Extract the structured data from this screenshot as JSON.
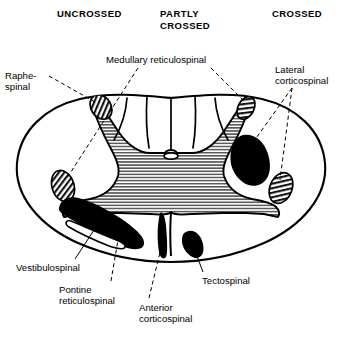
{
  "figure": {
    "headers": [
      {
        "id": "uncrossed",
        "text": "UNCROSSED"
      },
      {
        "id": "partly-crossed",
        "text": "PARTLY\nCROSSED"
      },
      {
        "id": "crossed",
        "text": "CROSSED"
      }
    ],
    "labels": [
      {
        "id": "raphespinal",
        "text": "Raphe-\nspinal"
      },
      {
        "id": "medullary-reticulospinal",
        "text": "Medullary reticulospinal"
      },
      {
        "id": "lateral-corticospinal",
        "text": "Lateral\ncorticospinal"
      },
      {
        "id": "vestibulospinal",
        "text": "Vestibulospinal"
      },
      {
        "id": "pontine-reticulospinal",
        "text": "Pontine\nreticulospinal"
      },
      {
        "id": "anterior-corticospinal",
        "text": "Anterior\ncorticospinal"
      },
      {
        "id": "tectospinal",
        "text": "Tectospinal"
      }
    ],
    "colors": {
      "background": "#ffffff",
      "outline": "#000000",
      "gray_matter_hatch": "#555555",
      "solid_tract": "#000000",
      "leader_line": "#000000"
    },
    "tracts": {
      "solid_black": [
        "lateral-corticospinal",
        "vestibulospinal",
        "pontine-reticulospinal",
        "anterior-corticospinal",
        "tectospinal"
      ],
      "diagonal_hatched": [
        "raphespinal",
        "medullary-reticulospinal"
      ],
      "horizontal_hatched": [
        "gray-matter"
      ]
    }
  }
}
